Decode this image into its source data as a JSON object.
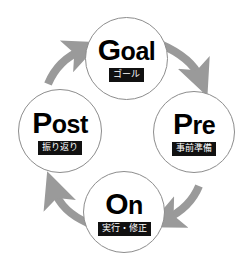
{
  "diagram": {
    "type": "cycle",
    "direction": "clockwise",
    "background_color": "#ffffff",
    "circle_stroke_color": "#8d8d8d",
    "label_background_color": "#111111",
    "label_text_color": "#ffffff",
    "arrow_color": "#9a9a9a",
    "nodes": [
      {
        "id": "goal",
        "title_cap": "G",
        "title_rest": "oal",
        "title_full": "Goal",
        "sub": "ゴール",
        "position": "top"
      },
      {
        "id": "pre",
        "title_cap": "P",
        "title_rest": "re",
        "title_full": "Pre",
        "sub": "事前準備",
        "position": "right"
      },
      {
        "id": "on",
        "title_cap": "O",
        "title_rest": "n",
        "title_full": "On",
        "sub": "実行・修正",
        "position": "bottom"
      },
      {
        "id": "post",
        "title_cap": "P",
        "title_rest": "ost",
        "title_full": "Post",
        "sub": "振り返り",
        "position": "left"
      }
    ],
    "arrows": [
      {
        "id": "goal-to-pre",
        "from": "goal",
        "to": "pre",
        "icon": "curved-arrow-icon"
      },
      {
        "id": "pre-to-on",
        "from": "pre",
        "to": "on",
        "icon": "curved-arrow-icon"
      },
      {
        "id": "on-to-post",
        "from": "on",
        "to": "post",
        "icon": "curved-arrow-icon"
      },
      {
        "id": "post-to-goal",
        "from": "post",
        "to": "goal",
        "icon": "curved-arrow-icon"
      }
    ]
  }
}
